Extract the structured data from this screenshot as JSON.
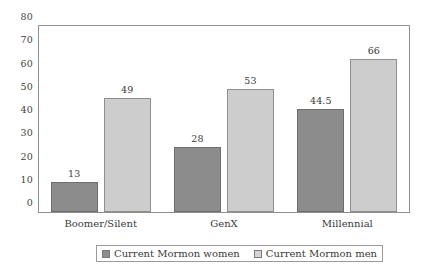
{
  "chart_data": {
    "type": "bar",
    "title": "",
    "subtitle": "",
    "xlabel": "",
    "ylabel": "",
    "categories": [
      "Boomer/Silent",
      "GenX",
      "Millennial"
    ],
    "series": [
      {
        "name": "Current Mormon women",
        "color": "#8c8c8c",
        "values": [
          13,
          28,
          44.5
        ],
        "labels": [
          "13",
          "28",
          "44.5"
        ]
      },
      {
        "name": "Current Mormon men",
        "color": "#cdcdcd",
        "values": [
          49,
          53,
          66
        ],
        "labels": [
          "49",
          "53",
          "66"
        ]
      }
    ],
    "ylim": [
      0,
      80
    ],
    "ytick_step": 10,
    "yticks": [
      "0",
      "10",
      "20",
      "30",
      "40",
      "50",
      "60",
      "70",
      "80"
    ],
    "grid": false,
    "legend_position": "bottom",
    "plot_border": true,
    "background_color": "#ffffff",
    "axis_color": "#8e8e8e"
  },
  "legend": {
    "entries": [
      {
        "label": "Current Mormon women",
        "swatch": "dark-gray-swatch"
      },
      {
        "label": "Current Mormon men",
        "swatch": "light-gray-swatch"
      }
    ]
  }
}
